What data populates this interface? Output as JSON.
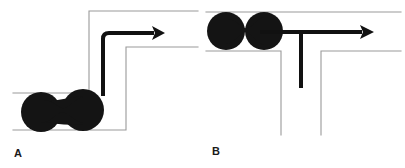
{
  "figure": {
    "background_color": "#ffffff",
    "wall_color": "#9a9a9a",
    "arrow_color": "#111111",
    "droplet_color": "#141414",
    "width": 405,
    "height": 168
  },
  "panels": [
    {
      "id": "A",
      "label": "A",
      "geometry_name": "l-bend-channel",
      "description": "Square L-bend microchannel with dumbbell droplet in the inlet arm and a bold flow arrow turning 90 degrees",
      "droplet": {
        "name": "dumbbell-droplet",
        "shape": "dumbbell",
        "lobe_count": 2,
        "color": "#141414",
        "left_lobe": {
          "cx": 41,
          "cy": 112,
          "r": 20
        },
        "right_lobe": {
          "cx": 83,
          "cy": 110,
          "r": 21
        },
        "neck_half_width": 9
      },
      "arrow": {
        "name": "flow-arrow",
        "path": "M 103 96 L 103 33 L 154 33",
        "head_x": 161,
        "head_y": 33,
        "stroke_width": 4,
        "corner_radius": 6,
        "color": "#111111",
        "direction": "up-then-right"
      },
      "walls": {
        "color": "#9a9a9a",
        "stroke_width": 1.1,
        "outer_path": "M 13 93 L 89 93 L 89 11 L 198 11",
        "inner_path": "M 13 130 L 126 130 L 126 47 L 198 47"
      }
    },
    {
      "id": "B",
      "label": "B",
      "geometry_name": "t-junction-channel",
      "description": "T-junction microchannel: horizontal main channel with a downward side branch, dumbbell droplet upstream and a bold T-shaped flow arrow",
      "droplet": {
        "name": "dumbbell-droplet",
        "shape": "dumbbell",
        "lobe_count": 2,
        "color": "#141414",
        "left_lobe": {
          "cx": 24,
          "cy": 31,
          "r": 19
        },
        "right_lobe": {
          "cx": 62,
          "cy": 31,
          "r": 19
        },
        "neck_half_width": 8
      },
      "arrow": {
        "name": "flow-arrow",
        "path": "M 58 32 L 160 32 M 99 32 L 99 88",
        "head_x": 168,
        "head_y": 32,
        "stroke_width": 4,
        "color": "#111111",
        "direction": "right-with-downward-branch"
      },
      "walls": {
        "color": "#9a9a9a",
        "stroke_width": 1.1,
        "top_path": "M 4 12 L 199 12",
        "bottom_left_path": "M 4 51 L 79 51 L 79 135",
        "bottom_right_path": "M 119 135 L 119 51 L 199 51"
      }
    }
  ]
}
